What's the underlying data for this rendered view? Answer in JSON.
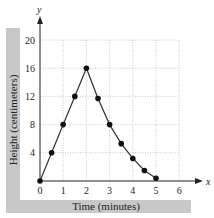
{
  "chart_data": {
    "type": "line",
    "title": "",
    "xlabel": "Time (minutes)",
    "ylabel": "Height (centimeters)",
    "x_axis_symbol": "x",
    "y_axis_symbol": "y",
    "xlim": [
      0,
      6
    ],
    "ylim": [
      0,
      20
    ],
    "x_ticks": [
      0,
      1,
      2,
      3,
      4,
      5,
      6
    ],
    "y_ticks": [
      4,
      8,
      12,
      16,
      20
    ],
    "grid": true,
    "legend": null,
    "series": [
      {
        "name": "height",
        "x": [
          0,
          0.5,
          1,
          1.5,
          2,
          2.5,
          3,
          3.5,
          4,
          4.5,
          5
        ],
        "values": [
          0,
          4,
          8,
          12,
          16,
          11.7,
          8,
          5.3,
          3.2,
          1.5,
          0.4
        ]
      }
    ]
  }
}
